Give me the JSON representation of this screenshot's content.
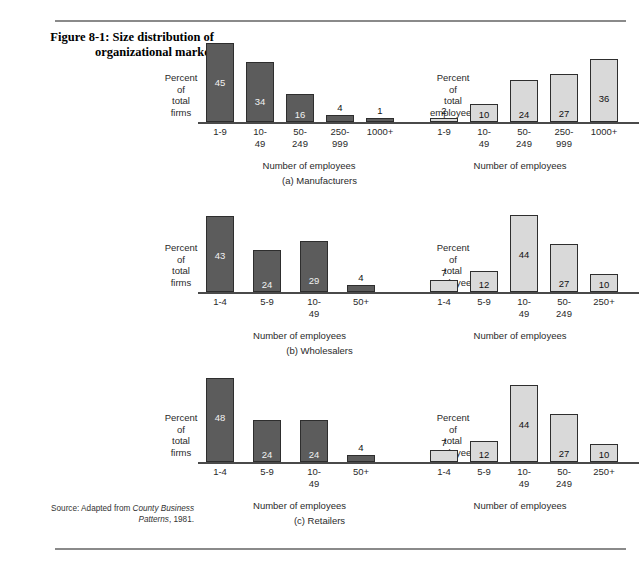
{
  "figure": {
    "title": "Figure 8-1: Size distribution of organizational market",
    "source_prefix": "Source: Adapted from ",
    "source_italic": "County Business Patterns",
    "source_suffix": ", 1981."
  },
  "labels": {
    "ylabel_firms": "Percent\nof\ntotal\nfirms",
    "ylabel_employees": "Percent\nof\ntotal\nemployees",
    "xlabel": "Number of employees"
  },
  "panels": [
    {
      "caption": "(a) Manufacturers"
    },
    {
      "caption": "(b) Wholesalers"
    },
    {
      "caption": "(c) Retailers"
    }
  ],
  "chart_data": [
    {
      "type": "bar",
      "title": "(a) Manufacturers — Percent of total firms",
      "categories": [
        "1-9",
        "10-\n49",
        "50-\n249",
        "250-\n999",
        "1000+"
      ],
      "values": [
        45,
        34,
        16,
        4,
        1
      ],
      "xlabel": "Number of employees",
      "ylabel": "Percent of total firms",
      "ylim": [
        0,
        50
      ],
      "grid": false,
      "legend": "none",
      "series_color": "#5c5c5c"
    },
    {
      "type": "bar",
      "title": "(a) Manufacturers — Percent of total employees",
      "categories": [
        "1-9",
        "10-\n49",
        "50-\n249",
        "250-\n999",
        "1000+"
      ],
      "values": [
        2,
        10,
        24,
        27,
        36
      ],
      "xlabel": "Number of employees",
      "ylabel": "Percent of total employees",
      "ylim": [
        0,
        50
      ],
      "grid": false,
      "legend": "none",
      "series_color": "#d9d9d9"
    },
    {
      "type": "bar",
      "title": "(b) Wholesalers — Percent of total firms",
      "categories": [
        "1-4",
        "5-9",
        "10-\n49",
        "50+"
      ],
      "values": [
        43,
        24,
        29,
        4
      ],
      "xlabel": "Number of employees",
      "ylabel": "Percent of total firms",
      "ylim": [
        0,
        50
      ],
      "grid": false,
      "legend": "none",
      "series_color": "#5c5c5c"
    },
    {
      "type": "bar",
      "title": "(b) Wholesalers — Percent of total employees",
      "categories": [
        "1-4",
        "5-9",
        "10-\n49",
        "50-\n249",
        "250+"
      ],
      "values": [
        7,
        12,
        44,
        27,
        10
      ],
      "xlabel": "Number of employees",
      "ylabel": "Percent of total employees",
      "ylim": [
        0,
        50
      ],
      "grid": false,
      "legend": "none",
      "series_color": "#d9d9d9"
    },
    {
      "type": "bar",
      "title": "(c) Retailers — Percent of total firms",
      "categories": [
        "1-4",
        "5-9",
        "10-\n49",
        "50+"
      ],
      "values": [
        48,
        24,
        24,
        4
      ],
      "xlabel": "Number of employees",
      "ylabel": "Percent of total firms",
      "ylim": [
        0,
        50
      ],
      "grid": false,
      "legend": "none",
      "series_color": "#5c5c5c"
    },
    {
      "type": "bar",
      "title": "(c) Retailers — Percent of total employees",
      "categories": [
        "1-4",
        "5-9",
        "10-\n49",
        "50-\n249",
        "250+"
      ],
      "values": [
        7,
        12,
        44,
        27,
        10
      ],
      "xlabel": "Number of employees",
      "ylabel": "Percent of total employees",
      "ylim": [
        0,
        50
      ],
      "grid": false,
      "legend": "none",
      "series_color": "#d9d9d9"
    }
  ]
}
